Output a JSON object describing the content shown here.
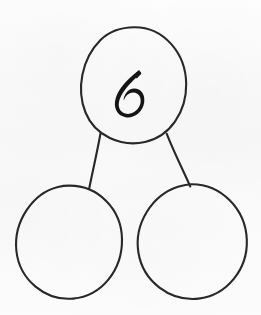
{
  "document": {
    "kind": "number-bond-diagram",
    "title": "Number bond",
    "background_color": "#fbfbfb",
    "ink_color": "#282828",
    "digit_color": "#151515",
    "width": 261,
    "height": 315
  },
  "diagram": {
    "whole": {
      "role": "whole",
      "value": "6",
      "filled": true,
      "shape": "ellipse",
      "center_x": 134,
      "center_y": 85,
      "radius_x": 52,
      "radius_y": 58
    },
    "parts": [
      {
        "role": "part-left",
        "value": "",
        "filled": false,
        "shape": "ellipse",
        "center_x": 69,
        "center_y": 242,
        "radius_x": 53,
        "radius_y": 57
      },
      {
        "role": "part-right",
        "value": "",
        "filled": false,
        "shape": "ellipse",
        "center_x": 192,
        "center_y": 242,
        "radius_x": 55,
        "radius_y": 57
      }
    ],
    "connectors": [
      {
        "role": "connector-left",
        "x1": 100,
        "y1": 134,
        "x2": 89,
        "y2": 188
      },
      {
        "role": "connector-right",
        "x1": 167,
        "y1": 134,
        "x2": 190,
        "y2": 186
      }
    ]
  }
}
